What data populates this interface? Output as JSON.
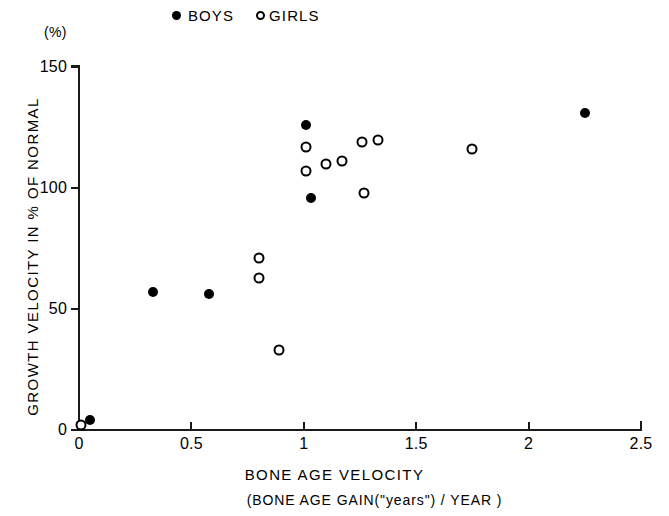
{
  "figure": {
    "unit_label": "(%)",
    "y_axis_title": "GROWTH VELOCITY IN % OF NORMAL",
    "x_axis_title": "BONE AGE VELOCITY",
    "x_axis_subtitle": "(BONE AGE GAIN(\"years\") / YEAR )"
  },
  "legend": {
    "position": "top",
    "entries": [
      {
        "label": "BOYS",
        "marker": "filled-circle-icon",
        "color": "#000000"
      },
      {
        "label": "GIRLS",
        "marker": "open-circle-icon",
        "color": "#000000"
      }
    ]
  },
  "axes": {
    "x_ticks": [
      "0",
      "0.5",
      "1",
      "1.5",
      "2",
      "2.5"
    ],
    "x_tick_values": [
      0,
      0.5,
      1,
      1.5,
      2,
      2.5
    ],
    "y_ticks": [
      "0",
      "50",
      "100",
      "150"
    ],
    "y_tick_values": [
      0,
      50,
      100,
      150
    ]
  },
  "chart_data": {
    "type": "scatter",
    "title": "",
    "xlabel": "BONE AGE VELOCITY (BONE AGE GAIN(\"years\") / YEAR )",
    "ylabel": "GROWTH VELOCITY IN % OF NORMAL",
    "xlim": [
      0,
      2.5
    ],
    "ylim": [
      0,
      150
    ],
    "grid": false,
    "legend_position": "top",
    "series": [
      {
        "name": "BOYS",
        "marker": "filled-circle",
        "color": "#000000",
        "points": [
          {
            "x": 0.05,
            "y": 4
          },
          {
            "x": 0.33,
            "y": 57
          },
          {
            "x": 0.58,
            "y": 56
          },
          {
            "x": 1.01,
            "y": 126
          },
          {
            "x": 1.03,
            "y": 96
          },
          {
            "x": 2.25,
            "y": 131
          }
        ]
      },
      {
        "name": "GIRLS",
        "marker": "open-circle",
        "color": "#000000",
        "points": [
          {
            "x": 0.01,
            "y": 2
          },
          {
            "x": 0.8,
            "y": 71
          },
          {
            "x": 0.8,
            "y": 63
          },
          {
            "x": 0.89,
            "y": 33
          },
          {
            "x": 1.01,
            "y": 117
          },
          {
            "x": 1.01,
            "y": 107
          },
          {
            "x": 1.1,
            "y": 110
          },
          {
            "x": 1.17,
            "y": 111
          },
          {
            "x": 1.26,
            "y": 119
          },
          {
            "x": 1.27,
            "y": 98
          },
          {
            "x": 1.33,
            "y": 120
          },
          {
            "x": 1.75,
            "y": 116
          }
        ]
      }
    ]
  }
}
